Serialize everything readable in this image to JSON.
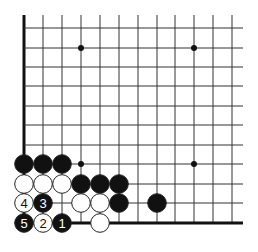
{
  "diagram": {
    "type": "go-board-problem",
    "grid": {
      "col_x": [
        24,
        43,
        62,
        81,
        100,
        119,
        138,
        157,
        175,
        194,
        213,
        232
      ],
      "row_y": [
        28,
        48,
        67,
        86,
        106,
        125,
        145,
        164,
        184,
        203,
        223
      ],
      "right_extent": 243,
      "top_extent": 15,
      "left_edge_bold": true,
      "bottom_edge_bold": true
    },
    "star_points": [
      {
        "col": 3,
        "row": 1
      },
      {
        "col": 9,
        "row": 1
      },
      {
        "col": 3,
        "row": 7
      },
      {
        "col": 9,
        "row": 7
      }
    ],
    "stones": [
      {
        "color": "black",
        "col": 0,
        "row": 7,
        "label": ""
      },
      {
        "color": "black",
        "col": 1,
        "row": 7,
        "label": ""
      },
      {
        "color": "black",
        "col": 2,
        "row": 7,
        "label": ""
      },
      {
        "color": "white",
        "col": 0,
        "row": 8,
        "label": ""
      },
      {
        "color": "white",
        "col": 1,
        "row": 8,
        "label": ""
      },
      {
        "color": "white",
        "col": 2,
        "row": 8,
        "label": ""
      },
      {
        "color": "black",
        "col": 3,
        "row": 8,
        "label": ""
      },
      {
        "color": "black",
        "col": 4,
        "row": 8,
        "label": ""
      },
      {
        "color": "black",
        "col": 5,
        "row": 8,
        "label": ""
      },
      {
        "color": "white",
        "col": 0,
        "row": 9,
        "label": "4"
      },
      {
        "color": "black",
        "col": 1,
        "row": 9,
        "label": "3"
      },
      {
        "color": "white",
        "col": 3,
        "row": 9,
        "label": ""
      },
      {
        "color": "white",
        "col": 4,
        "row": 9,
        "label": ""
      },
      {
        "color": "black",
        "col": 5,
        "row": 9,
        "label": ""
      },
      {
        "color": "black",
        "col": 7,
        "row": 9,
        "label": ""
      },
      {
        "color": "black",
        "col": 0,
        "row": 10,
        "label": "5"
      },
      {
        "color": "white",
        "col": 1,
        "row": 10,
        "label": "2"
      },
      {
        "color": "black",
        "col": 2,
        "row": 10,
        "label": "1"
      },
      {
        "color": "white",
        "col": 4,
        "row": 10,
        "label": ""
      }
    ],
    "colors": {
      "line": "#333333",
      "edge": "#111111",
      "black_stone": "#111111",
      "white_stone": "#ffffff",
      "stone_outline": "#222222"
    }
  }
}
